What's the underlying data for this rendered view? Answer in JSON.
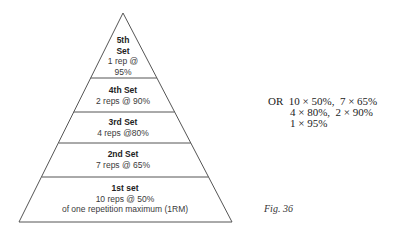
{
  "pyramid": {
    "tiers": [
      {
        "title": "5th",
        "title2": "Set",
        "line1": "1 rep @",
        "line2": "95%"
      },
      {
        "title": "4th Set",
        "line1": "2 reps @ 90%"
      },
      {
        "title": "3rd Set",
        "line1": "4 reps @80%"
      },
      {
        "title": "2nd Set",
        "line1": "7 reps @ 65%"
      },
      {
        "title": "1st set",
        "line1": "10 reps @ 50%",
        "line2": "of one repetition maximum (1RM)"
      }
    ],
    "colors": {
      "stroke": "#555555",
      "text": "#3a3a3a"
    }
  },
  "alternative": {
    "rows": [
      "OR  10 × 50%,  7 × 65%",
      "        4 × 80%,  2 × 90%",
      "        1 × 95%"
    ]
  },
  "caption": "Fig.  36"
}
